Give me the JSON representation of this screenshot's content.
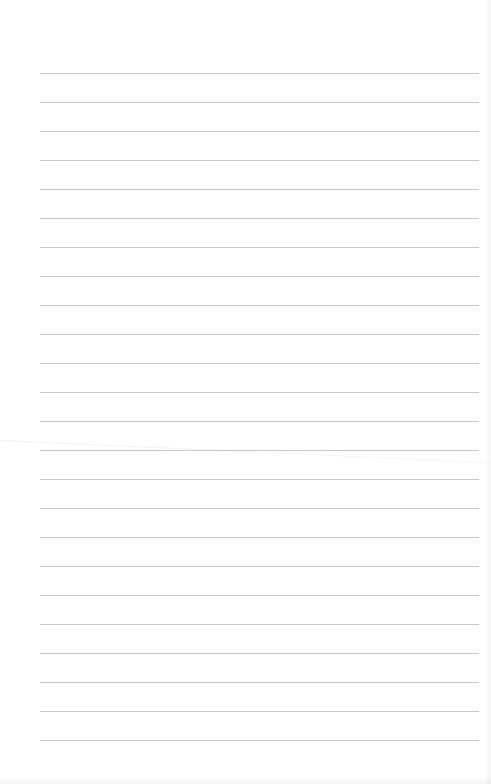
{
  "page": {
    "type": "lined-paper",
    "background_color": "#ffffff",
    "rule_color": "#c9c9c9",
    "rule_count": 24,
    "rule_left_px": 40,
    "rule_right_px": 479,
    "first_rule_y_px": 73,
    "rule_spacing_px": 29,
    "text_content": ""
  }
}
